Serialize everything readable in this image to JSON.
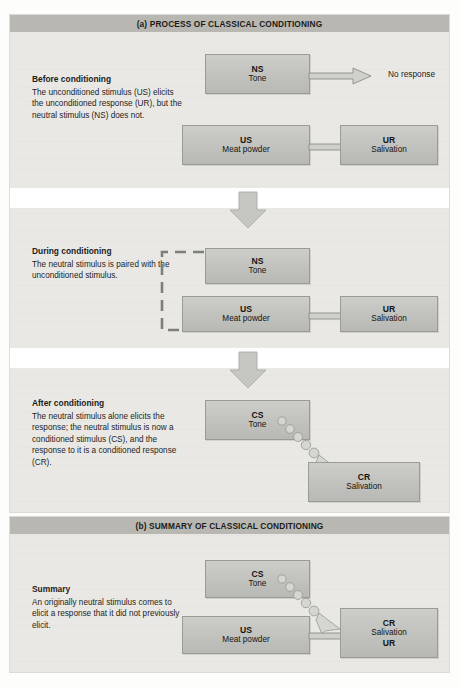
{
  "figure": {
    "panels": [
      {
        "id": "a",
        "header": "(a) PROCESS OF CLASSICAL CONDITIONING",
        "sections": [
          {
            "id": "before",
            "heading": "Before conditioning",
            "body": "The unconditioned stimulus (US)  elicits the unconditioned response (UR), but the neutral stimulus (NS) does not.",
            "boxes": [
              {
                "abbr": "NS",
                "word": "Tone"
              },
              {
                "abbr": "US",
                "word": "Meat powder"
              },
              {
                "abbr": "UR",
                "word": "Salivation"
              }
            ],
            "outcome_label": "No response"
          },
          {
            "id": "during",
            "heading": "During conditioning",
            "body": "The neutral stimulus is paired with the unconditioned stimulus.",
            "boxes": [
              {
                "abbr": "NS",
                "word": "Tone"
              },
              {
                "abbr": "US",
                "word": "Meat powder"
              },
              {
                "abbr": "UR",
                "word": "Salivation"
              }
            ]
          },
          {
            "id": "after",
            "heading": "After conditioning",
            "body": "The neutral stimulus alone elicits the response; the neutral stimulus is now a conditioned stimulus (CS), and the response to it is a conditioned response (CR).",
            "boxes": [
              {
                "abbr": "CS",
                "word": "Tone"
              },
              {
                "abbr": "CR",
                "word": "Salivation"
              }
            ]
          }
        ]
      },
      {
        "id": "b",
        "header": "(b) SUMMARY OF CLASSICAL CONDITIONING",
        "sections": [
          {
            "id": "summary",
            "heading": "Summary",
            "body": "An originally neutral stimulus comes to elicit a response that it did not previously elicit.",
            "boxes": [
              {
                "abbr": "CS",
                "word": "Tone"
              },
              {
                "abbr": "US",
                "word": "Meat powder"
              },
              {
                "abbr": "CR",
                "word": "Salivation",
                "abbr2": "UR"
              }
            ]
          }
        ]
      }
    ],
    "colors": {
      "panel_background": "#e9e8e4",
      "header_background": "#b9b7b1",
      "box_fill": "#c3c3bf",
      "box_border": "#9a9a96",
      "arrow_fill": "#cfcfcb",
      "arrow_stroke": "#8d8d89",
      "text": "#1e1e1e",
      "divider": "#ffffff"
    }
  }
}
